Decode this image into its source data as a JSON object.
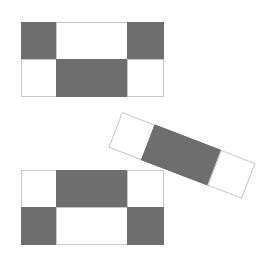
{
  "scene": {
    "title": "Geometric Tile Pieces",
    "background_color": "#ffffff",
    "width": 275,
    "height": 254
  },
  "palette": {
    "fill_gray": "#6e6e6e",
    "empty_white": "#ffffff",
    "outline": "#c8c8c8"
  },
  "pieces": [
    {
      "id": "piece-top",
      "name": "top-rectangle-piece",
      "shape": "rectangle",
      "rows": 2,
      "cols": 3,
      "column_weights": [
        1,
        2,
        1
      ],
      "x": 21,
      "y": 22,
      "width": 142,
      "height": 74,
      "rotation_deg": 0,
      "cells": [
        {
          "label": "r1c1",
          "filled": true
        },
        {
          "label": "r1c2",
          "filled": false
        },
        {
          "label": "r1c3",
          "filled": true
        },
        {
          "label": "r2c1",
          "filled": false
        },
        {
          "label": "r2c2",
          "filled": true
        },
        {
          "label": "r2c3",
          "filled": false
        }
      ]
    },
    {
      "id": "piece-middle",
      "name": "rotated-strip-piece",
      "shape": "strip",
      "rows": 1,
      "cols": 3,
      "column_weights": [
        1,
        2,
        1
      ],
      "x": 122,
      "y": 112,
      "width": 142,
      "height": 37,
      "rotation_deg": 21,
      "cells": [
        {
          "label": "c1",
          "filled": false
        },
        {
          "label": "c2",
          "filled": true
        },
        {
          "label": "c3",
          "filled": false
        }
      ]
    },
    {
      "id": "piece-bottom",
      "name": "bottom-rectangle-piece",
      "shape": "rectangle",
      "rows": 2,
      "cols": 3,
      "column_weights": [
        1,
        2,
        1
      ],
      "x": 21,
      "y": 170,
      "width": 142,
      "height": 74,
      "rotation_deg": 0,
      "cells": [
        {
          "label": "r1c1",
          "filled": false
        },
        {
          "label": "r1c2",
          "filled": true
        },
        {
          "label": "r1c3",
          "filled": false
        },
        {
          "label": "r2c1",
          "filled": true
        },
        {
          "label": "r2c2",
          "filled": false
        },
        {
          "label": "r2c3",
          "filled": true
        }
      ]
    }
  ]
}
